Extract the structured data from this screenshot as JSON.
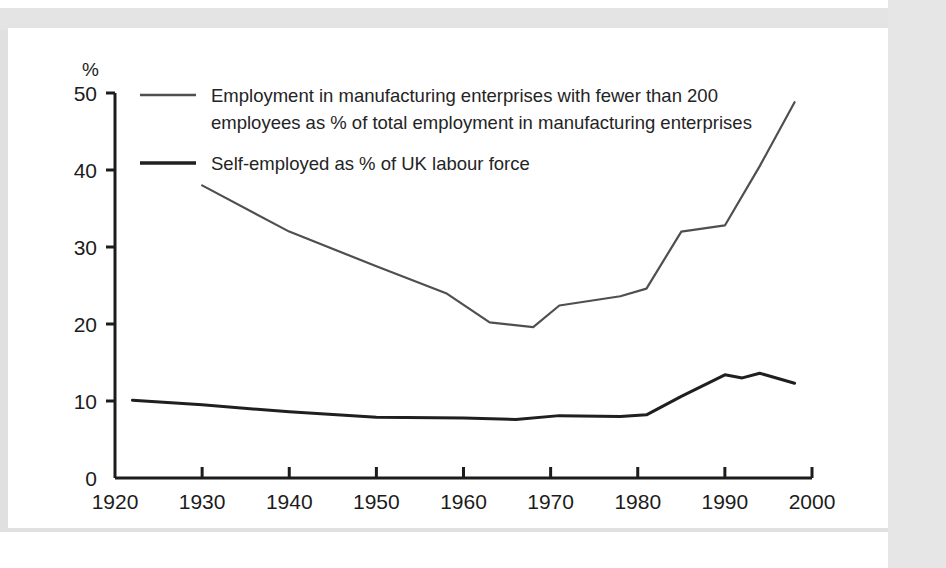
{
  "figure": {
    "background_color": "#ffffff",
    "frame_color": "#e2e2e2",
    "axis_color": "#1c1c1c"
  },
  "chart_data": {
    "type": "line",
    "title": "",
    "xlabel": "",
    "ylabel": "%",
    "ylabel_position": "top-left",
    "xlim": [
      1920,
      2000
    ],
    "ylim": [
      0,
      50
    ],
    "grid": false,
    "legend_position": "inside-top-left",
    "xticks": [
      1920,
      1930,
      1940,
      1950,
      1960,
      1970,
      1980,
      1990,
      2000
    ],
    "xticklabels": [
      "1920",
      "1930",
      "1940",
      "1950",
      "1960",
      "1970",
      "1980",
      "1990",
      "2000"
    ],
    "yticks": [
      0,
      10,
      20,
      30,
      40,
      50
    ],
    "yticklabels": [
      "0",
      "10",
      "20",
      "30",
      "40",
      "50"
    ],
    "series": [
      {
        "name": "small-firm-manufacturing-employment-share",
        "label_line1": "Employment in manufacturing enterprises with fewer than 200",
        "label_line2": "employees as % of total employment in manufacturing enterprises",
        "color": "#4f4f4f",
        "stroke_width": 2.2,
        "x": [
          1930,
          1940,
          1950,
          1958,
          1963,
          1968,
          1971,
          1978,
          1981,
          1985,
          1990,
          1994,
          1998
        ],
        "y": [
          38.0,
          32.0,
          27.5,
          24.0,
          20.2,
          19.6,
          22.4,
          23.6,
          24.6,
          32.0,
          32.8,
          40.5,
          48.8
        ]
      },
      {
        "name": "self-employed-share-uk-labour-force",
        "label_line1": "Self-employed as % of UK labour force",
        "label_line2": "",
        "color": "#1f1f1f",
        "stroke_width": 3.0,
        "x": [
          1922,
          1930,
          1940,
          1950,
          1960,
          1966,
          1971,
          1978,
          1981,
          1985,
          1990,
          1992,
          1994,
          1998
        ],
        "y": [
          10.1,
          9.5,
          8.6,
          7.9,
          7.8,
          7.6,
          8.1,
          8.0,
          8.2,
          10.6,
          13.4,
          13.0,
          13.6,
          12.3
        ]
      }
    ]
  },
  "legend": {
    "entries": [
      {
        "swatch_name": "legend-swatch-manufacturing",
        "line1": "Employment in manufacturing enterprises with fewer than 200",
        "line2": "employees as % of total employment in manufacturing enterprises"
      },
      {
        "swatch_name": "legend-swatch-self-employed",
        "line1": "Self-employed as % of UK labour force",
        "line2": ""
      }
    ]
  },
  "axis": {
    "y_unit_label": "%"
  }
}
